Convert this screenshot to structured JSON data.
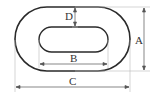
{
  "diagram": {
    "labels": {
      "A": "A",
      "B": "B",
      "C": "C",
      "D": "D"
    },
    "colors": {
      "outline": "#2a2a2a",
      "dimension_line": "#555555",
      "extension_line": "#bbbbbb",
      "text": "#333333"
    }
  }
}
